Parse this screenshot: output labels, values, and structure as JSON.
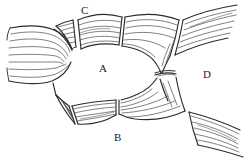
{
  "figure": {
    "background_color": "#ffffff",
    "ink_color": "#2b2b2f",
    "fiber_color": "#4a4a52",
    "width": 245,
    "height": 159,
    "style": "pen-and-ink line drawing"
  },
  "labels": [
    {
      "id": "A",
      "text": "A",
      "role": "central-enclosed-region",
      "x": 103,
      "y": 70
    },
    {
      "id": "B",
      "text": "B",
      "role": "lower-band-label",
      "x": 118,
      "y": 140
    },
    {
      "id": "C",
      "text": "C",
      "role": "upper-band-label",
      "x": 85,
      "y": 12
    },
    {
      "id": "D",
      "text": "D",
      "role": "right-region-label",
      "x": 207,
      "y": 76
    }
  ],
  "parts": {
    "left_bundle": {
      "name": "left-fiber-bundle",
      "description": "Wide striated bundle entering from the left edge, narrowing and splitting into upper and lower branches around the central ring",
      "fiber_count": 7
    },
    "upper_left_band": {
      "name": "upper-left-band",
      "description": "Short striated band segment angled up-right, left of label C",
      "fiber_count": 5
    },
    "upper_center_band": {
      "name": "upper-center-band",
      "description": "Curved striated band beneath label C forming the top of the ring",
      "fiber_count": 6
    },
    "upper_right_junction": {
      "name": "upper-right-y-junction",
      "description": "Striated band narrowing from upper right toward the central isthmus",
      "fiber_count": 7
    },
    "upper_right_tail": {
      "name": "upper-right-tail-segment",
      "description": "Diagonally striated segment running off the top-right edge",
      "fiber_count": 6
    },
    "isthmus": {
      "name": "central-isthmus",
      "description": "Narrow waist where the upper-right and lower-right junctions meet"
    },
    "lower_right_junction": {
      "name": "lower-right-y-junction",
      "description": "Striated band spreading from the isthmus down and to the right",
      "fiber_count": 7
    },
    "lower_right_tail": {
      "name": "lower-right-tail-segment",
      "description": "Diagonally striated segment running off the bottom-right edge",
      "fiber_count": 6
    },
    "lower_center_band": {
      "name": "lower-center-band",
      "description": "Curved striated band above label B forming the bottom of the ring",
      "fiber_count": 5
    },
    "lower_left_band": {
      "name": "lower-left-band",
      "description": "Short striated band segment at the lower left of the ring",
      "fiber_count": 5
    }
  }
}
